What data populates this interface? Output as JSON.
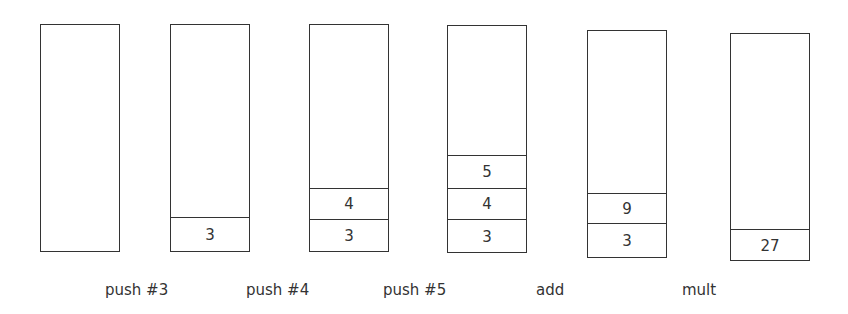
{
  "diagram": {
    "title": "",
    "stacks": [
      {
        "id": "initial",
        "cells": []
      },
      {
        "id": "after-push-3",
        "cells": [
          "3"
        ]
      },
      {
        "id": "after-push-4",
        "cells": [
          "3",
          "4"
        ]
      },
      {
        "id": "after-push-5",
        "cells": [
          "3",
          "4",
          "5"
        ]
      },
      {
        "id": "after-add",
        "cells": [
          "3",
          "9"
        ]
      },
      {
        "id": "after-mult",
        "cells": [
          "27"
        ]
      }
    ],
    "operations": [
      "push #3",
      "push #4",
      "push #5",
      "add",
      "mult"
    ]
  }
}
